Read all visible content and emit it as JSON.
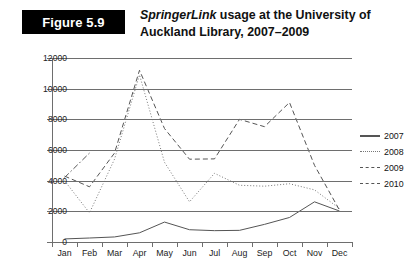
{
  "figure": {
    "badge_label": "Figure 5.9",
    "title_emphasis": "SpringerLink",
    "title_rest": " usage at the University of Auckland Library, 2007–2009"
  },
  "chart_data": {
    "type": "line",
    "xlabel": "",
    "ylabel": "",
    "categories": [
      "Jan",
      "Feb",
      "Mar",
      "Apr",
      "May",
      "Jun",
      "Jul",
      "Aug",
      "Sep",
      "Oct",
      "Nov",
      "Dec"
    ],
    "ylim": [
      0,
      12000
    ],
    "ytick_values": [
      0,
      2000,
      4000,
      6000,
      8000,
      10000,
      12000
    ],
    "ytick_labels": [
      "0",
      "2000",
      "4000",
      "6000",
      "8000",
      "10000",
      "12000"
    ],
    "grid": true,
    "legend_position": "right",
    "series": [
      {
        "name": "2007",
        "style": "solid",
        "color": "#555555",
        "values": [
          200,
          260,
          330,
          600,
          1300,
          800,
          740,
          760,
          1150,
          1600,
          2620,
          2020
        ]
      },
      {
        "name": "2008",
        "style": "dotted",
        "color": "#777777",
        "values": [
          4000,
          1900,
          5400,
          10900,
          5200,
          2620,
          4480,
          3700,
          3640,
          3800,
          3400,
          2180
        ]
      },
      {
        "name": "2009",
        "style": "dashed",
        "color": "#555555",
        "values": [
          4300,
          3600,
          5800,
          11200,
          7400,
          5400,
          5420,
          8000,
          7520,
          9100,
          5000,
          2080
        ]
      },
      {
        "name": "2010",
        "style": "dashdot",
        "color": "#555555",
        "values": [
          4200,
          5800,
          null,
          null,
          null,
          null,
          null,
          null,
          null,
          null,
          null,
          null
        ]
      }
    ]
  },
  "legend": {
    "items": [
      {
        "label": "2007"
      },
      {
        "label": "2008"
      },
      {
        "label": "2009"
      },
      {
        "label": "2010"
      }
    ]
  }
}
